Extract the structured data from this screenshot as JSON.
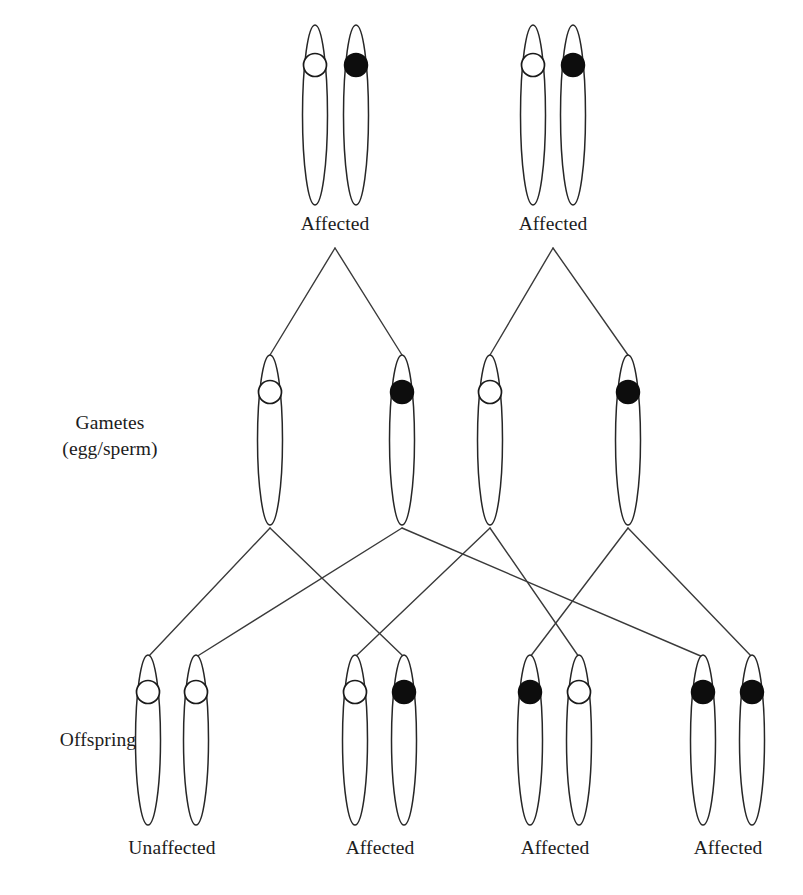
{
  "diagram": {
    "row_labels": {
      "gametes_line1": "Gametes",
      "gametes_line2": "(egg/sperm)",
      "offspring": "Offspring"
    },
    "legend": {
      "open_allele": "unaffected allele",
      "filled_allele": "affected allele"
    },
    "colors": {
      "stroke": "#262626",
      "line": "#3a3a3a",
      "filled_allele": "#0d0d0d",
      "open_allele": "#ffffff",
      "background": "#ffffff"
    },
    "parents": [
      {
        "label": "Affected",
        "label_x": 335,
        "label_y": 213,
        "genotype": [
          "open",
          "filled"
        ],
        "chromosomes": [
          {
            "cx": 315,
            "cy": 115,
            "marker": "open"
          },
          {
            "cx": 356,
            "cy": 115,
            "marker": "filled"
          }
        ]
      },
      {
        "label": "Affected",
        "label_x": 553,
        "label_y": 213,
        "genotype": [
          "open",
          "filled"
        ],
        "chromosomes": [
          {
            "cx": 533,
            "cy": 115,
            "marker": "open"
          },
          {
            "cx": 573,
            "cy": 115,
            "marker": "filled"
          }
        ]
      }
    ],
    "gametes": [
      {
        "cx": 270,
        "cy": 440,
        "marker": "open",
        "from_parent": 0
      },
      {
        "cx": 402,
        "cy": 440,
        "marker": "filled",
        "from_parent": 0
      },
      {
        "cx": 490,
        "cy": 440,
        "marker": "open",
        "from_parent": 1
      },
      {
        "cx": 628,
        "cy": 440,
        "marker": "filled",
        "from_parent": 1
      }
    ],
    "offspring": [
      {
        "label": "Unaffected",
        "label_x": 172,
        "label_y": 837,
        "genotype": [
          "open",
          "open"
        ],
        "chromosomes": [
          {
            "cx": 148,
            "cy": 740,
            "marker": "open"
          },
          {
            "cx": 196,
            "cy": 740,
            "marker": "open"
          }
        ]
      },
      {
        "label": "Affected",
        "label_x": 380,
        "label_y": 837,
        "genotype": [
          "open",
          "filled"
        ],
        "chromosomes": [
          {
            "cx": 355,
            "cy": 740,
            "marker": "open"
          },
          {
            "cx": 404,
            "cy": 740,
            "marker": "filled"
          }
        ]
      },
      {
        "label": "Affected",
        "label_x": 555,
        "label_y": 837,
        "genotype": [
          "filled",
          "open"
        ],
        "chromosomes": [
          {
            "cx": 530,
            "cy": 740,
            "marker": "filled"
          },
          {
            "cx": 579,
            "cy": 740,
            "marker": "open"
          }
        ]
      },
      {
        "label": "Affected",
        "label_x": 728,
        "label_y": 837,
        "genotype": [
          "filled",
          "filled"
        ],
        "chromosomes": [
          {
            "cx": 703,
            "cy": 740,
            "marker": "filled"
          },
          {
            "cx": 752,
            "cy": 740,
            "marker": "filled"
          }
        ]
      }
    ],
    "geometry": {
      "parent_chromosome": {
        "rx": 12.5,
        "ry": 90,
        "marker_r": 11.5,
        "marker_offset": -50
      },
      "gamete_chromosome": {
        "rx": 12.5,
        "ry": 85,
        "marker_r": 11.5,
        "marker_offset": -48
      },
      "offspring_chromosome": {
        "rx": 12.5,
        "ry": 85,
        "marker_r": 11.5,
        "marker_offset": -48
      },
      "parent_fork_y": 248,
      "gamete_fork_y": 530
    },
    "parent_links": [
      {
        "from_x": 335,
        "from_y": 248,
        "to_x": 270,
        "to_y": 355
      },
      {
        "from_x": 335,
        "from_y": 248,
        "to_x": 402,
        "to_y": 355
      },
      {
        "from_x": 553,
        "from_y": 248,
        "to_x": 490,
        "to_y": 355
      },
      {
        "from_x": 553,
        "from_y": 248,
        "to_x": 628,
        "to_y": 355
      }
    ],
    "gamete_links": [
      {
        "from_x": 270,
        "from_y": 528,
        "to_x": 148,
        "to_y": 657
      },
      {
        "from_x": 270,
        "from_y": 528,
        "to_x": 404,
        "to_y": 657
      },
      {
        "from_x": 402,
        "from_y": 528,
        "to_x": 196,
        "to_y": 657
      },
      {
        "from_x": 402,
        "from_y": 528,
        "to_x": 703,
        "to_y": 657
      },
      {
        "from_x": 490,
        "from_y": 528,
        "to_x": 355,
        "to_y": 657
      },
      {
        "from_x": 490,
        "from_y": 528,
        "to_x": 579,
        "to_y": 657
      },
      {
        "from_x": 628,
        "from_y": 528,
        "to_x": 530,
        "to_y": 657
      },
      {
        "from_x": 628,
        "from_y": 528,
        "to_x": 752,
        "to_y": 657
      }
    ],
    "side_labels": {
      "gametes_x": 110,
      "gametes_y": 410,
      "offspring_x": 98,
      "offspring_y": 727
    }
  }
}
